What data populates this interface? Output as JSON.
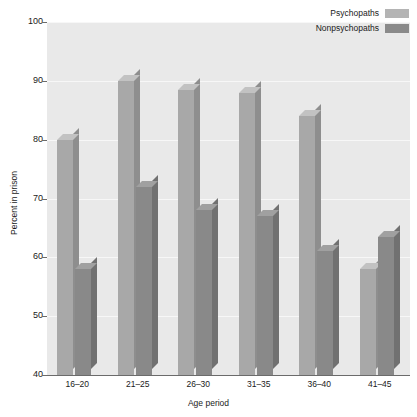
{
  "chart_data": {
    "type": "bar",
    "title": "",
    "xlabel": "Age period",
    "ylabel": "Percent in prison",
    "categories": [
      "16–20",
      "21–25",
      "26–30",
      "31–35",
      "36–40",
      "41–45"
    ],
    "series": [
      {
        "name": "Psychopaths",
        "color": "#b4b4b4",
        "values": [
          80,
          90,
          88.5,
          88,
          84,
          58
        ]
      },
      {
        "name": "Nonpsychopaths",
        "color": "#8a8a8a",
        "values": [
          58,
          72,
          68,
          67,
          61,
          63.5
        ]
      }
    ],
    "ylim": [
      40,
      100
    ],
    "yticks": [
      100,
      90,
      80,
      70,
      60,
      50,
      40
    ],
    "ytick_labels": [
      "100",
      "90",
      "80",
      "70",
      "60",
      "50",
      "40"
    ],
    "grid": true,
    "grid_color": "#f7f7f7",
    "plot_background": "#e9e9e9",
    "legend_position": "top-right"
  }
}
